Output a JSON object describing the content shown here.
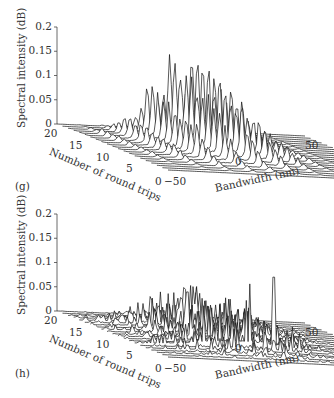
{
  "figure": {
    "panels": [
      {
        "tag": "(g)",
        "zlabel": "Spectral intensity (dB)",
        "round_trips_label": "Number of round trips",
        "bandwidth_label": "Bandwidth (nm)",
        "z_ticks": [
          "0.2",
          "0.15",
          "0.1",
          "0.05",
          "0"
        ],
        "round_trip_ticks": [
          "20",
          "15",
          "10",
          "5",
          "0"
        ],
        "bandwidth_ticks": [
          "−50",
          "0",
          "50"
        ]
      },
      {
        "tag": "(h)",
        "zlabel": "Spectral intensity (dB)",
        "round_trips_label": "Number of round trips",
        "bandwidth_label": "Bandwidth (nm)",
        "z_ticks": [
          "0.2",
          "0.15",
          "0.1",
          "0.05",
          "0"
        ],
        "round_trip_ticks": [
          "20",
          "15",
          "10",
          "5",
          "0"
        ],
        "bandwidth_ticks": [
          "−50",
          "0",
          "50"
        ]
      }
    ]
  },
  "chart_data": [
    {
      "type": "area",
      "subtype": "3d-waterfall",
      "title": "(g)",
      "xlabel": "Bandwidth (nm)",
      "ylabel": "Number of round trips",
      "zlabel": "Spectral intensity (dB)",
      "xlim": [
        -50,
        50
      ],
      "ylim": [
        0,
        20
      ],
      "zlim": [
        0,
        0.2
      ],
      "x_ticks": [
        -50,
        0,
        50
      ],
      "y_ticks": [
        0,
        5,
        10,
        15,
        20
      ],
      "z_ticks": [
        0,
        0.05,
        0.1,
        0.15,
        0.2
      ],
      "grid": false,
      "description": "Regular comb of sharp spectral peaks growing with round trips; tallest peaks ~0.2 near the back rows, decreasing toward the front.",
      "peak_series": {
        "round_trip": [
          20,
          19,
          18,
          17,
          16,
          15,
          14,
          13,
          12,
          11,
          10,
          9,
          8,
          7,
          6,
          5,
          4,
          3,
          2,
          1,
          0
        ],
        "max_intensity": [
          0.01,
          0.03,
          0.07,
          0.11,
          0.2,
          0.2,
          0.18,
          0.18,
          0.16,
          0.16,
          0.14,
          0.14,
          0.12,
          0.12,
          0.08,
          0.06,
          0.04,
          0.02,
          0.01,
          0.005,
          0.0
        ]
      }
    },
    {
      "type": "area",
      "subtype": "3d-waterfall",
      "title": "(h)",
      "xlabel": "Bandwidth (nm)",
      "ylabel": "Number of round trips",
      "zlabel": "Spectral intensity (dB)",
      "xlim": [
        -50,
        50
      ],
      "ylim": [
        0,
        20
      ],
      "zlim": [
        0,
        0.2
      ],
      "x_ticks": [
        -50,
        0,
        50
      ],
      "y_ticks": [
        0,
        5,
        10,
        15,
        20
      ],
      "z_ticks": [
        0,
        0.05,
        0.1,
        0.15,
        0.2
      ],
      "grid": false,
      "description": "Irregular, noise-like spectral spikes mostly ~0.08–0.12, with one isolated tall spike ~0.15 near the right.",
      "peak_series": {
        "round_trip": [
          20,
          19,
          18,
          17,
          16,
          15,
          14,
          13,
          12,
          11,
          10,
          9,
          8,
          7,
          6,
          5,
          4,
          3,
          2,
          1,
          0
        ],
        "max_intensity": [
          0.01,
          0.02,
          0.05,
          0.09,
          0.11,
          0.1,
          0.11,
          0.1,
          0.12,
          0.1,
          0.09,
          0.1,
          0.08,
          0.09,
          0.15,
          0.06,
          0.05,
          0.03,
          0.02,
          0.01,
          0.0
        ]
      }
    }
  ]
}
